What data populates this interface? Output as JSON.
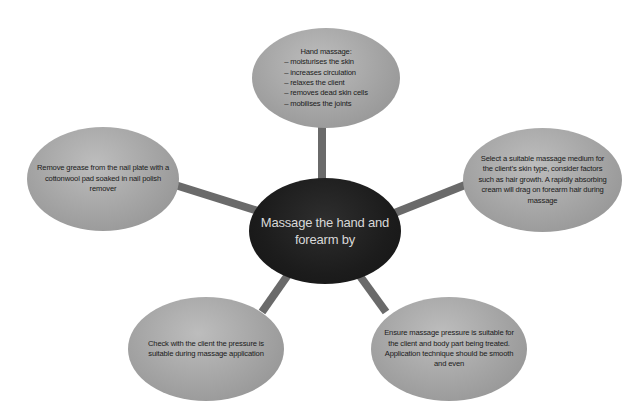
{
  "diagram": {
    "center": {
      "label_line1": "Massage the hand and",
      "label_line2": "forearm by"
    },
    "nodes": {
      "top": {
        "title": "Hand massage:",
        "items": [
          "– moisturises the skin",
          "– increases circulation",
          "– relaxes the client",
          "– removes dead skin cells",
          "– mobilises the joints"
        ]
      },
      "left": {
        "lines": [
          "Remove grease from the nail plate with a",
          "cottonwool pad soaked in nail polish",
          "remover"
        ]
      },
      "right": {
        "lines": [
          "Select a suitable massage medium for",
          "the client’s skin type, consider factors",
          "such as hair growth. A rapidly absorbing",
          "cream will drag on forearm hair during",
          "massage"
        ]
      },
      "bottom_left": {
        "lines": [
          "Check with the client the pressure is",
          "suitable during massage application"
        ]
      },
      "bottom_right": {
        "lines": [
          "Ensure massage pressure is suitable for",
          "the client and body part being treated.",
          "Application technique should be smooth",
          "and even"
        ]
      }
    },
    "colors": {
      "connector": "#6a6a6a",
      "satellite_fill": "#a6a6a6",
      "center_fill": "#1c1c1c",
      "center_text": "#d8d8d8"
    }
  }
}
